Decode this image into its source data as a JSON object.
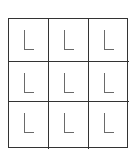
{
  "grid": {
    "rows": 3,
    "cols": 3,
    "cells": [
      {
        "letter": "L"
      },
      {
        "letter": "L"
      },
      {
        "letter": "L"
      },
      {
        "letter": "L"
      },
      {
        "letter": "L"
      },
      {
        "letter": "L"
      },
      {
        "letter": "L"
      },
      {
        "letter": "L"
      },
      {
        "letter": "L"
      }
    ]
  },
  "colors": {
    "border": "#333333",
    "letter": "#6a6a6a",
    "background": "#ffffff"
  }
}
